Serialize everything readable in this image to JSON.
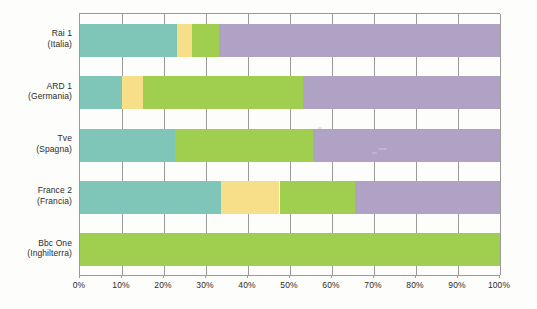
{
  "chart_data": {
    "type": "bar",
    "orientation": "horizontal",
    "stacked": true,
    "normalized_percent": true,
    "title": "",
    "subtitle": "",
    "xlabel": "",
    "ylabel": "",
    "xlim": [
      0,
      100
    ],
    "xticks": [
      0,
      10,
      20,
      30,
      40,
      50,
      60,
      70,
      80,
      90,
      100
    ],
    "xtick_labels": [
      "0%",
      "10%",
      "20%",
      "30%",
      "40%",
      "50%",
      "60%",
      "70%",
      "80%",
      "90%",
      "100%"
    ],
    "grid": "vertical",
    "legend": "none",
    "categories": [
      {
        "line1": "Rai 1",
        "line2": "(Italia)"
      },
      {
        "line1": "ARD 1",
        "line2": "(Germania)"
      },
      {
        "line1": "Tve",
        "line2": "(Spagna)"
      },
      {
        "line1": "France 2",
        "line2": "(Francia)"
      },
      {
        "line1": "Bbc One",
        "line2": "(Inghilterra)"
      }
    ],
    "series": [
      {
        "name": "teal",
        "color": "#7fc6b8",
        "values": [
          23,
          10,
          22.5,
          33.5,
          0
        ]
      },
      {
        "name": "yellow",
        "color": "#f7de89",
        "values": [
          3.7,
          5,
          0,
          14,
          0
        ]
      },
      {
        "name": "green",
        "color": "#a0ce4e",
        "values": [
          6.3,
          38,
          33,
          18,
          100
        ]
      },
      {
        "name": "purple",
        "color": "#afa2c4",
        "values": [
          67,
          47,
          44.5,
          34.5,
          0
        ]
      }
    ],
    "bars": [
      {
        "category": "Rai 1 (Italia)",
        "segments": [
          {
            "series": "teal",
            "start": 0,
            "end": 23,
            "value": 23,
            "color": "#7fc6b8"
          },
          {
            "series": "yellow",
            "start": 23,
            "end": 26.7,
            "value": 3.7,
            "color": "#f7de89"
          },
          {
            "series": "green",
            "start": 26.7,
            "end": 33,
            "value": 6.3,
            "color": "#a0ce4e"
          },
          {
            "series": "purple",
            "start": 33,
            "end": 100,
            "value": 67,
            "color": "#afa2c4"
          }
        ]
      },
      {
        "category": "ARD 1 (Germania)",
        "segments": [
          {
            "series": "teal",
            "start": 0,
            "end": 10,
            "value": 10,
            "color": "#7fc6b8"
          },
          {
            "series": "yellow",
            "start": 10,
            "end": 15,
            "value": 5,
            "color": "#f7de89"
          },
          {
            "series": "green",
            "start": 15,
            "end": 53,
            "value": 38,
            "color": "#a0ce4e"
          },
          {
            "series": "purple",
            "start": 53,
            "end": 100,
            "value": 47,
            "color": "#afa2c4"
          }
        ]
      },
      {
        "category": "Tve (Spagna)",
        "segments": [
          {
            "series": "teal",
            "start": 0,
            "end": 22.5,
            "value": 22.5,
            "color": "#7fc6b8"
          },
          {
            "series": "green",
            "start": 22.5,
            "end": 55.5,
            "value": 33,
            "color": "#a0ce4e"
          },
          {
            "series": "purple",
            "start": 55.5,
            "end": 100,
            "value": 44.5,
            "color": "#afa2c4"
          }
        ]
      },
      {
        "category": "France 2 (Francia)",
        "segments": [
          {
            "series": "teal",
            "start": 0,
            "end": 33.5,
            "value": 33.5,
            "color": "#7fc6b8"
          },
          {
            "series": "yellow",
            "start": 33.5,
            "end": 47.5,
            "value": 14,
            "color": "#f7de89"
          },
          {
            "series": "green",
            "start": 47.5,
            "end": 65.5,
            "value": 18,
            "color": "#a0ce4e"
          },
          {
            "series": "purple",
            "start": 65.5,
            "end": 100,
            "value": 34.5,
            "color": "#afa2c4"
          }
        ]
      },
      {
        "category": "Bbc One (Inghilterra)",
        "segments": [
          {
            "series": "green",
            "start": 0,
            "end": 100,
            "value": 100,
            "color": "#a0ce4e"
          }
        ]
      }
    ]
  },
  "colors": {
    "teal": "#7fc6b8",
    "yellow": "#f7de89",
    "green": "#a0ce4e",
    "purple": "#afa2c4",
    "axis": "#9a9a9a",
    "text": "#2b2b2b",
    "background": "#fdfdfb"
  }
}
